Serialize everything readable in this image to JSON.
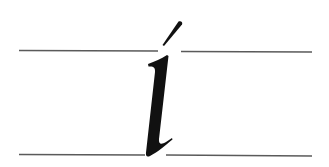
{
  "figure": {
    "character": "í",
    "description_label": "Italic lowercase i with acute accent between guide lines",
    "colors": {
      "background": "#ffffff",
      "guide_line": "#5a5a5a",
      "glyph": "#111111"
    },
    "guides": [
      {
        "name": "x-height-line",
        "y": 51
      },
      {
        "name": "baseline",
        "y": 155
      }
    ]
  }
}
